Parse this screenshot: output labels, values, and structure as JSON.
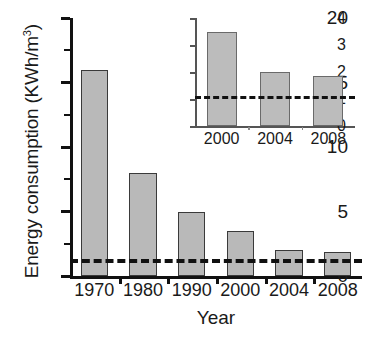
{
  "chart_data": [
    {
      "id": "main",
      "type": "bar",
      "title": "",
      "xlabel": "Year",
      "ylabel": "Energy consumption (KWh/m",
      "ylabel_sup": "3",
      "ylabel_suffix": ")",
      "categories": [
        "1970",
        "1980",
        "1990",
        "2000",
        "2004",
        "2008"
      ],
      "values": [
        16,
        8,
        5,
        3.5,
        2,
        1.85
      ],
      "ylim": [
        0,
        20
      ],
      "yticks": [
        0,
        5,
        10,
        15,
        20
      ],
      "ytick_labels": [
        "0",
        "5",
        "10",
        "15",
        "20"
      ],
      "yminor_ticks": [
        2.5,
        7.5,
        12.5,
        17.5
      ],
      "grid": false,
      "legend": "none",
      "annotations": [
        {
          "type": "threshold-line",
          "name": "threshold-line",
          "value": 1,
          "style": "dashed"
        }
      ],
      "bar_color": "#b9b9b9",
      "bar_edge_color": "#3a3a3a",
      "axis_color": "#111111"
    },
    {
      "id": "inset",
      "type": "bar",
      "title": "",
      "xlabel": "",
      "ylabel": "",
      "categories": [
        "2000",
        "2004",
        "2008"
      ],
      "values": [
        3.5,
        2.0,
        1.85
      ],
      "ylim": [
        0,
        4
      ],
      "yticks": [
        0,
        1,
        2,
        3,
        4
      ],
      "ytick_labels": [
        "0",
        "1",
        "2",
        "3",
        "4"
      ],
      "yminor_ticks": [],
      "grid": false,
      "legend": "none",
      "annotations": [
        {
          "type": "threshold-line",
          "name": "threshold-line",
          "value": 1,
          "style": "dashed"
        }
      ],
      "bar_color": "#bcbcbc",
      "bar_edge_color": "#6a6a6a",
      "axis_color": "#555555"
    }
  ]
}
